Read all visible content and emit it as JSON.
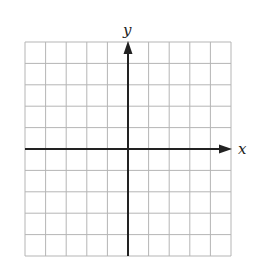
{
  "figure": {
    "type": "coordinate-grid",
    "grid": {
      "columns": 10,
      "rows": 10,
      "line_color": "#b5b5b5",
      "axis_color": "#222222"
    },
    "axes": {
      "x_label": "x",
      "y_label": "y",
      "origin_column": 5,
      "origin_row": 5
    }
  }
}
